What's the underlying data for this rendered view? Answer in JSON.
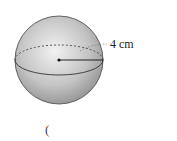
{
  "diagram": {
    "shape": "sphere",
    "radius_label": "4 cm",
    "answer_paren": "(",
    "colors": {
      "sphere_light": "#e6e6e6",
      "sphere_dark": "#9a9a9a",
      "outline": "#333333",
      "text": "#222222"
    }
  }
}
